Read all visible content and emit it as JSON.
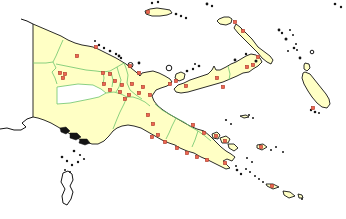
{
  "map": {
    "width": 346,
    "height": 219,
    "colors": {
      "background": "#ffffff",
      "land_fill": "#ffffc5",
      "coastline": "#141414",
      "province_boundary": "#6cc46c",
      "nodata_fill": "#ffffff",
      "marker_fill": "#ef6551",
      "marker_stroke": "#a93b2a",
      "islet_fill": "#141414"
    },
    "landmasses": [
      {
        "name": "mainland-papua-new-guinea",
        "path": "M 33,24 L 40,27 L 47,30 L 54,33 L 61,36 L 68,40 L 75,43 L 82,45 L 88,46 L 93,47 L 98,49 L 104,52 L 110,55 L 116,58 L 121,61 L 126,64 L 131,68 L 136,72 L 140,76 L 142,73 L 147,72 L 153,71 L 159,73 L 165,76 L 170,79 L 172,82 L 167,86 L 161,88 L 156,90 L 152,96 L 154,101 L 158,106 L 163,110 L 169,114 L 176,118 L 183,122 L 190,126 L 197,129 L 204,131 L 210,136 L 216,142 L 221,147 L 226,151 L 231,154 L 235,157 L 232,161 L 227,159 L 223,161 L 227,165 L 230,168 L 226,169 L 220,166 L 214,163 L 208,160 L 201,157 L 194,153 L 187,151 L 180,148 L 175,145 L 169,143 L 162,140 L 155,136 L 148,132 L 141,128 L 134,126 L 128,125 L 122,126 L 117,128 L 113,131 L 109,136 L 104,141 L 98,144 L 92,144 L 86,142 L 79,139 L 72,135 L 65,131 L 58,127 L 51,123 L 44,120 L 38,118 L 33,117 Z"
      },
      {
        "name": "new-britain-island",
        "path": "M 174,89 L 178,85 L 184,83 L 190,80 L 196,78 L 202,76 L 208,74 L 212,70 L 214,66 L 216,70 L 220,70 L 226,67 L 231,64 L 236,62 L 241,59 L 246,56 L 251,54 L 256,55 L 260,58 L 262,62 L 258,66 L 253,69 L 249,72 L 243,73 L 237,76 L 230,79 L 223,82 L 216,84 L 209,86 L 202,88 L 195,90 L 188,92 L 181,93 L 176,92 Z"
      },
      {
        "name": "new-ireland-island",
        "path": "M 236,24 L 240,27 L 244,31 L 248,35 L 252,39 L 255,43 L 258,47 L 262,50 L 266,53 L 270,56 L 273,60 L 271,64 L 267,62 L 262,58 L 258,53 L 254,49 L 250,45 L 246,41 L 242,37 L 238,33 L 234,28 Z"
      },
      {
        "name": "new-hanover-island",
        "path": "M 219,19 L 224,17 L 229,17 L 232,19 L 231,23 L 226,25 L 220,24 L 217,21 Z"
      },
      {
        "name": "manus-island",
        "path": "M 145,11 L 150,9 L 157,8 L 164,9 L 170,10 L 172,13 L 167,15 L 160,16 L 152,16 L 146,14 Z"
      },
      {
        "name": "buka-island",
        "path": "M 305,63 L 309,64 L 310,68 L 307,71 L 304,69 L 304,65 Z"
      },
      {
        "name": "bougainville-island",
        "path": "M 305,72 L 310,74 L 314,79 L 318,84 L 322,89 L 326,94 L 329,99 L 330,104 L 327,108 L 322,107 L 317,103 L 312,97 L 308,91 L 304,84 L 302,78 L 303,73 Z"
      },
      {
        "name": "umboi-island",
        "path": "M 176,74 L 181,72 L 185,74 L 184,79 L 179,81 L 175,78 Z"
      },
      {
        "name": "goodenough-island",
        "path": "M 212,134 L 217,132 L 220,135 L 218,139 L 213,138 Z"
      },
      {
        "name": "fergusson-island",
        "path": "M 220,138 L 226,136 L 230,139 L 228,143 L 222,143 Z"
      },
      {
        "name": "normanby-island",
        "path": "M 228,144 L 234,144 L 238,148 L 234,151 L 229,148 Z"
      },
      {
        "name": "kiriwina-island",
        "path": "M 240,116 L 246,115 L 249,117 L 244,118 Z"
      },
      {
        "name": "woodlark-island",
        "path": "M 257,145 L 263,144 L 267,147 L 262,150 L 257,148 Z"
      },
      {
        "name": "misima-island",
        "path": "M 266,184 L 273,184 L 279,187 L 273,189 L 267,186 Z"
      },
      {
        "name": "tagula-island",
        "path": "M 283,191 L 290,192 L 295,196 L 289,198 L 284,195 Z"
      },
      {
        "name": "rossel-island",
        "path": "M 298,194 L 302,195 L 303,198 L 299,198 Z"
      }
    ],
    "nodata_regions": [
      {
        "name": "highlands-nodata-province",
        "path": "M 57,87 L 78,84 L 93,85 L 101,89 L 106,93 L 99,97 L 90,99 L 80,101 L 70,103 L 57,104 Z"
      }
    ],
    "foreign_landmasses": [
      {
        "name": "cape-york-australia",
        "path": "M 63,173 L 68,171 L 72,174 L 73,180 L 70,186 L 73,192 L 71,199 L 67,205 L 63,203 L 62,196 L 65,189 L 61,182 Z"
      }
    ],
    "foreign_coastlines": [
      {
        "name": "indonesia-north-coast",
        "path": "M 21,19 L 27,21 L 33,24"
      },
      {
        "name": "indonesia-south-coast",
        "path": "M 33,117 L 27,119 L 22,123 L 26,127 L 21,130 L 14,130 L 7,128 L 0,129"
      }
    ],
    "delta_blobs": [
      {
        "name": "fly-delta-island",
        "path": "M 60,128 L 66,127 L 70,131 L 66,134 L 61,132 Z"
      },
      {
        "name": "fly-delta-island",
        "path": "M 70,133 L 77,133 L 81,137 L 76,140 L 70,138 Z"
      },
      {
        "name": "fly-delta-island",
        "path": "M 80,139 L 87,139 L 90,143 L 85,145 L 79,143 Z"
      }
    ],
    "province_boundaries": [
      "M 33,63 L 46,63 L 53,62 L 56,56 L 59,49 L 63,40",
      "M 53,62 L 56,68 L 52,72 L 55,78 L 57,84",
      "M 56,64 L 66,66 L 76,68 L 86,70 L 96,71 L 103,72 L 110,71 L 117,67 L 124,63",
      "M 103,72 L 104,78 L 103,84",
      "M 111,72 L 113,80 L 112,87",
      "M 117,67 L 119,74 L 121,80 L 119,87 L 116,92",
      "M 106,93 L 114,92 L 121,94 L 127,97 L 124,104 L 120,112 L 117,119 L 113,129",
      "M 127,97 L 133,97 L 139,99 L 145,102 L 150,106",
      "M 124,63 L 126,68 L 128,75 L 127,83 L 130,90 L 136,95 L 142,99",
      "M 155,104 L 162,110 L 169,114 L 176,118 L 184,122 L 191,127 L 198,131 L 205,136 L 211,141",
      "M 176,118 L 172,126 L 169,133 L 166,139",
      "M 198,131 L 195,140 L 192,147",
      "M 228,66 L 230,74 L 229,80"
    ],
    "ring_islands": [
      {
        "name": "karkar-island",
        "x": 130.5,
        "y": 65,
        "r": 2.5
      },
      {
        "name": "long-island",
        "x": 169,
        "y": 68,
        "r": 2.8
      },
      {
        "name": "nissan-atoll",
        "x": 312,
        "y": 52,
        "r": 1.8
      }
    ],
    "islets": [
      [
        152,
        3,
        1.2
      ],
      [
        158,
        2,
        1.2
      ],
      [
        176,
        14,
        1.3
      ],
      [
        181,
        16,
        1.2
      ],
      [
        186,
        18,
        1.2
      ],
      [
        207,
        4,
        1.4
      ],
      [
        212,
        6,
        1.2
      ],
      [
        95,
        41,
        1
      ],
      [
        99,
        45,
        1.2
      ],
      [
        104,
        48,
        1.2
      ],
      [
        110,
        51,
        1.3
      ],
      [
        116,
        54,
        1.2
      ],
      [
        121,
        58,
        1.2
      ],
      [
        119,
        56,
        1.4
      ],
      [
        139,
        63,
        1.4
      ],
      [
        187,
        71,
        1.3
      ],
      [
        193,
        69,
        1.2
      ],
      [
        199,
        66,
        1.3
      ],
      [
        195,
        64,
        1
      ],
      [
        235,
        60,
        1.4
      ],
      [
        246,
        54,
        1.2
      ],
      [
        256,
        61,
        1.5
      ],
      [
        279,
        30,
        1.4
      ],
      [
        282,
        33,
        1.2
      ],
      [
        286,
        39,
        1.5
      ],
      [
        294,
        48,
        1.3
      ],
      [
        297,
        50,
        1
      ],
      [
        300,
        58,
        1.4
      ],
      [
        290,
        30,
        1
      ],
      [
        293,
        35,
        1
      ],
      [
        288,
        51,
        1
      ],
      [
        296,
        44,
        1
      ],
      [
        335,
        4,
        1.3
      ],
      [
        341,
        7,
        1.2
      ],
      [
        311,
        110,
        1.2
      ],
      [
        315,
        112,
        1.3
      ],
      [
        319,
        113,
        1
      ],
      [
        237,
        170,
        1.3
      ],
      [
        241,
        174,
        1.2
      ],
      [
        246,
        169,
        1
      ],
      [
        250,
        172,
        1
      ],
      [
        236,
        166,
        1
      ],
      [
        226,
        120,
        1.1
      ],
      [
        231,
        124,
        1
      ],
      [
        249,
        115,
        1
      ],
      [
        253,
        118,
        1
      ],
      [
        271,
        150,
        1
      ],
      [
        276,
        147,
        1
      ],
      [
        283,
        152,
        1
      ],
      [
        255,
        176,
        1
      ],
      [
        259,
        179,
        1
      ],
      [
        263,
        182,
        1
      ],
      [
        62,
        157,
        1.3
      ],
      [
        67,
        161,
        1.2
      ],
      [
        72,
        165,
        1.2
      ],
      [
        78,
        162,
        1.2
      ],
      [
        84,
        159,
        1.1
      ],
      [
        65,
        170,
        1
      ],
      [
        70,
        172,
        1
      ],
      [
        74,
        151,
        1.3
      ],
      [
        80,
        155,
        1.1
      ],
      [
        302,
        199,
        1
      ],
      [
        247,
        158,
        1
      ],
      [
        252,
        162,
        1
      ]
    ],
    "town_markers": [
      [
        77,
        56
      ],
      [
        96,
        47
      ],
      [
        60,
        73
      ],
      [
        65,
        74
      ],
      [
        63,
        78
      ],
      [
        103,
        73
      ],
      [
        110,
        74
      ],
      [
        115,
        81
      ],
      [
        104,
        84
      ],
      [
        122,
        85
      ],
      [
        132,
        84
      ],
      [
        110,
        90
      ],
      [
        120,
        92
      ],
      [
        129,
        95
      ],
      [
        139,
        93
      ],
      [
        125,
        99
      ],
      [
        130,
        66
      ],
      [
        139,
        73
      ],
      [
        143,
        87
      ],
      [
        150,
        95
      ],
      [
        170,
        84
      ],
      [
        148,
        115
      ],
      [
        153,
        124
      ],
      [
        158,
        135
      ],
      [
        152,
        137
      ],
      [
        165,
        142
      ],
      [
        177,
        148
      ],
      [
        187,
        153
      ],
      [
        197,
        157
      ],
      [
        207,
        160
      ],
      [
        193,
        125
      ],
      [
        204,
        133
      ],
      [
        225,
        163
      ],
      [
        148,
        12
      ],
      [
        235,
        22
      ],
      [
        243,
        31
      ],
      [
        258,
        57
      ],
      [
        176,
        81
      ],
      [
        186,
        86
      ],
      [
        217,
        78
      ],
      [
        223,
        87
      ],
      [
        247,
        67
      ],
      [
        253,
        65
      ],
      [
        216,
        136
      ],
      [
        225,
        141
      ],
      [
        261,
        147
      ],
      [
        272,
        186
      ],
      [
        313,
        108
      ]
    ],
    "marker_size": 3.2
  }
}
